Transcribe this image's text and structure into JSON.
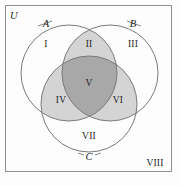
{
  "figure": {
    "type": "venn-diagram-three-sets",
    "colors": {
      "background": "#fdfdfd",
      "frame_stroke": "#8f8f8f",
      "circle_stroke": "#7a7a7a",
      "shade_light": "#d4d4d4",
      "shade_dark": "#a8a8a8",
      "text": "#1d1d1d"
    },
    "universe_label": "U",
    "set_labels": {
      "a": "A",
      "b": "B",
      "c": "C"
    },
    "regions": [
      {
        "id": "I",
        "label": "I",
        "shaded": false,
        "shade": "none"
      },
      {
        "id": "II",
        "label": "II",
        "shaded": true,
        "shade": "light"
      },
      {
        "id": "III",
        "label": "III",
        "shaded": false,
        "shade": "none"
      },
      {
        "id": "IV",
        "label": "IV",
        "shaded": true,
        "shade": "light"
      },
      {
        "id": "V",
        "label": "V",
        "shaded": true,
        "shade": "dark"
      },
      {
        "id": "VI",
        "label": "VI",
        "shaded": true,
        "shade": "light"
      },
      {
        "id": "VII",
        "label": "VII",
        "shaded": false,
        "shade": "none"
      },
      {
        "id": "VIII",
        "label": "VIII",
        "shaded": false,
        "shade": "none"
      }
    ]
  }
}
